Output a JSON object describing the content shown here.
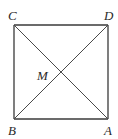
{
  "figure": {
    "type": "square-with-diagonals",
    "stroke_color": "#3a3a3a",
    "background": "#ffffff",
    "vertices": [
      {
        "name": "C",
        "x": 14,
        "y": 25,
        "label_x": 8,
        "label_y": 20
      },
      {
        "name": "D",
        "x": 108,
        "y": 25,
        "label_x": 104,
        "label_y": 20
      },
      {
        "name": "A",
        "x": 108,
        "y": 119,
        "label_x": 104,
        "label_y": 135
      },
      {
        "name": "B",
        "x": 14,
        "y": 119,
        "label_x": 8,
        "label_y": 135
      }
    ],
    "center": {
      "name": "M",
      "x": 61,
      "y": 72,
      "label_x": 38,
      "label_y": 80
    },
    "segments": [
      {
        "from": "C",
        "to": "D"
      },
      {
        "from": "D",
        "to": "A"
      },
      {
        "from": "A",
        "to": "B"
      },
      {
        "from": "B",
        "to": "C"
      },
      {
        "from": "C",
        "to": "A"
      },
      {
        "from": "B",
        "to": "D"
      }
    ]
  },
  "labels": {
    "C": "C",
    "D": "D",
    "A": "A",
    "B": "B",
    "M": "M"
  }
}
